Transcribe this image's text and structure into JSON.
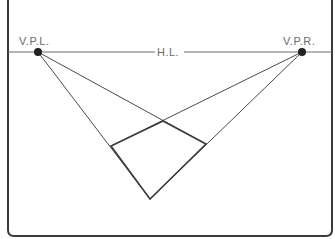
{
  "diagram": {
    "type": "two-point-perspective",
    "labels": {
      "vp_left": "V.P.L.",
      "vp_right": "V.P.R.",
      "horizon": "H.L."
    },
    "colors": {
      "frame": "#3a3a3a",
      "construction_line": "#4a4a4a",
      "object_line": "#3c3c3c",
      "horizon_line": "#6a6a6a",
      "label": "#6a6a6a",
      "vanishing_point": "#222222"
    },
    "points": {
      "vp_left": [
        38,
        52
      ],
      "vp_right": [
        302,
        52
      ],
      "top": [
        163,
        121
      ],
      "left": [
        111,
        146
      ],
      "right": [
        206,
        144
      ],
      "bottom": [
        150,
        199
      ]
    }
  }
}
